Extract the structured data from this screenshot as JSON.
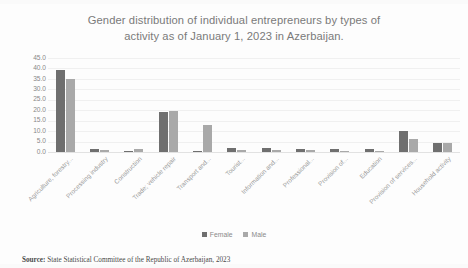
{
  "chart_data": {
    "type": "bar",
    "title": "Gender distribution of individual entrepreneurs by types of activity as of January 1, 2023 in Azerbaijan.",
    "title_line1": "Gender distribution of individual entrepreneurs by types of",
    "title_line2": "activity as of January 1, 2023 in Azerbaijan.",
    "xlabel": "",
    "ylabel": "",
    "ylim": [
      0,
      45
    ],
    "ytick_labels": [
      "45.0",
      "40.0",
      "35.0",
      "30.0",
      "25.0",
      "20.0",
      "15.0",
      "10.0",
      "5.0",
      "0.0"
    ],
    "ytick_values": [
      45,
      40,
      35,
      30,
      25,
      20,
      15,
      10,
      5,
      0
    ],
    "grid": true,
    "legend_position": "bottom",
    "categories": [
      "Agriculture, forestry...",
      "Processing industry",
      "Construction",
      "Trade; vehicle repair",
      "Transport and...",
      "Tourist...",
      "Information and...",
      "Professional...",
      "Provision of...",
      "Education",
      "Provision of services...",
      "Household activity"
    ],
    "series": [
      {
        "name": "Female",
        "color": "#6f6f6f",
        "values": [
          39.3,
          1.5,
          0.3,
          19.1,
          0.7,
          1.9,
          1.9,
          1.4,
          1.4,
          1.6,
          10.0,
          4.3
        ]
      },
      {
        "name": "Male",
        "color": "#a9a9a9",
        "values": [
          35.0,
          1.2,
          1.5,
          19.6,
          13.0,
          1.2,
          1.1,
          0.9,
          0.7,
          0.5,
          6.2,
          4.3
        ]
      }
    ]
  },
  "legend": {
    "items": [
      {
        "label": "Female",
        "color": "#6f6f6f"
      },
      {
        "label": "Male",
        "color": "#a9a9a9"
      }
    ]
  },
  "source": {
    "label": "Source:",
    "text": "State Statistical Committee of the Republic of Azerbaijan, 2023"
  }
}
